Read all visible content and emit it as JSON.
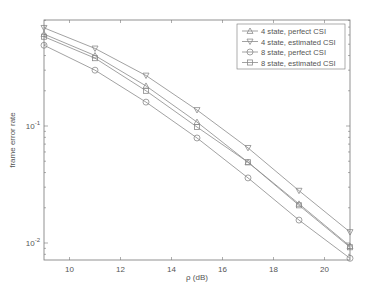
{
  "chart_data": {
    "type": "line",
    "title": "",
    "xlabel": "ρ (dB)",
    "ylabel": "frame error rate",
    "xscale": "linear",
    "yscale": "log",
    "xlim": [
      9,
      21
    ],
    "ylim": [
      0.0075,
      0.9
    ],
    "grid": false,
    "legend_position": "upper right",
    "x": [
      9,
      11,
      13,
      15,
      17,
      19,
      21
    ],
    "x_ticks": [
      10,
      12,
      14,
      16,
      18,
      20
    ],
    "x_tick_labels": [
      "10",
      "12",
      "14",
      "16",
      "18",
      "20"
    ],
    "y_ticks": [
      0.1,
      0.01
    ],
    "y_tick_labels": [
      "10^-1",
      "10^-2"
    ],
    "series": [
      {
        "name": "4 state, perfect CSI",
        "marker": "triangle-up",
        "values": [
          0.61,
          0.4,
          0.22,
          0.108,
          0.049,
          0.0216,
          0.0094
        ]
      },
      {
        "name": "4 state, estimated CSI",
        "marker": "triangle-down",
        "values": [
          0.69,
          0.46,
          0.27,
          0.137,
          0.065,
          0.028,
          0.0124
        ]
      },
      {
        "name": "8 state, perfect CSI",
        "marker": "circle",
        "values": [
          0.49,
          0.3,
          0.16,
          0.079,
          0.036,
          0.0157,
          0.0074
        ]
      },
      {
        "name": "8 state, estimated CSI",
        "marker": "square",
        "values": [
          0.58,
          0.38,
          0.2,
          0.098,
          0.049,
          0.021,
          0.0092
        ]
      }
    ]
  },
  "colors": {
    "line": "#8a8a8a",
    "axis": "#777777",
    "text": "#555555",
    "background": "#ffffff"
  }
}
